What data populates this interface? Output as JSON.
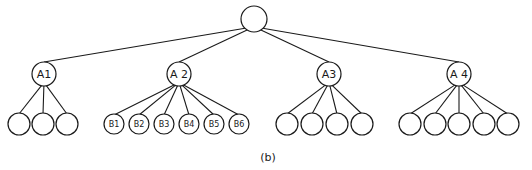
{
  "diagram": {
    "type": "tree",
    "caption": "(b)",
    "root": {
      "id": "root",
      "label": "",
      "x": 254,
      "y": 19,
      "r": 13
    },
    "level1": [
      {
        "id": "A1",
        "label": "A1",
        "x": 44,
        "y": 74,
        "r": 12,
        "children": [
          {
            "label": "",
            "x": 19,
            "y": 124
          },
          {
            "label": "",
            "x": 43,
            "y": 124
          },
          {
            "label": "",
            "x": 67,
            "y": 124
          }
        ]
      },
      {
        "id": "A2",
        "label": "A 2",
        "x": 179,
        "y": 74,
        "r": 12,
        "children": [
          {
            "label": "B1",
            "x": 114,
            "y": 124
          },
          {
            "label": "B2",
            "x": 139,
            "y": 124
          },
          {
            "label": "B3",
            "x": 164,
            "y": 124
          },
          {
            "label": "B4",
            "x": 189,
            "y": 124
          },
          {
            "label": "B5",
            "x": 214,
            "y": 124
          },
          {
            "label": "B6",
            "x": 239,
            "y": 124
          }
        ]
      },
      {
        "id": "A3",
        "label": "A3",
        "x": 329,
        "y": 74,
        "r": 12,
        "children": [
          {
            "label": "",
            "x": 287,
            "y": 124
          },
          {
            "label": "",
            "x": 312,
            "y": 124
          },
          {
            "label": "",
            "x": 337,
            "y": 124
          },
          {
            "label": "",
            "x": 362,
            "y": 124
          }
        ]
      },
      {
        "id": "A4",
        "label": "A 4",
        "x": 459,
        "y": 74,
        "r": 12,
        "children": [
          {
            "label": "",
            "x": 410,
            "y": 124
          },
          {
            "label": "",
            "x": 435,
            "y": 124
          },
          {
            "label": "",
            "x": 459,
            "y": 124
          },
          {
            "label": "",
            "x": 484,
            "y": 124
          },
          {
            "label": "",
            "x": 508,
            "y": 124
          }
        ]
      }
    ],
    "leaf_radius": 11,
    "labeled_leaf_radius": 10
  }
}
